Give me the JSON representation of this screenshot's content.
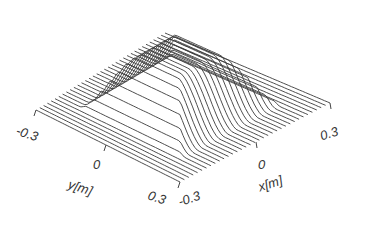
{
  "chart_data": {
    "type": "surface3d",
    "title": "",
    "style": "wireframe line-plot (parallel slices)",
    "x_axis": {
      "label": "x[m]",
      "ticks": [
        "-0.3",
        "0",
        "0.3"
      ],
      "range": [
        -0.3,
        0.3
      ]
    },
    "y_axis": {
      "label": "y[m]",
      "ticks": [
        "-0.3",
        "0",
        "0.3"
      ],
      "range": [
        -0.3,
        0.3
      ]
    },
    "z_axis": {
      "label": "",
      "ticks": []
    },
    "slices": 34,
    "bump_extent": {
      "x": [
        -0.2,
        0.2
      ],
      "y": [
        -0.2,
        0.2
      ]
    },
    "line_color": "#3a3a3a"
  },
  "labels": {
    "y_min": "-0.3",
    "y_mid": "0",
    "y_label": "y[m]",
    "y_max": "0.3",
    "x_min": "-0.3",
    "x_mid": "0",
    "x_label": "x[m]",
    "x_max": "0.3"
  }
}
